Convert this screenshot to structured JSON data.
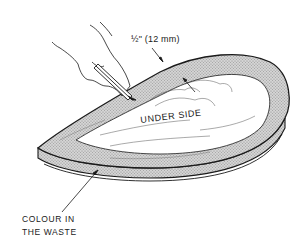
{
  "diagram": {
    "labels": {
      "measurement": "½\" (12 mm)",
      "face": "UNDER SIDE",
      "callout_line1": "COLOUR IN",
      "callout_line2": "THE WASTE"
    },
    "colors": {
      "ink": "#1a1a1a",
      "waste_hatch": "#bdbdbd",
      "paper": "#ffffff"
    }
  }
}
